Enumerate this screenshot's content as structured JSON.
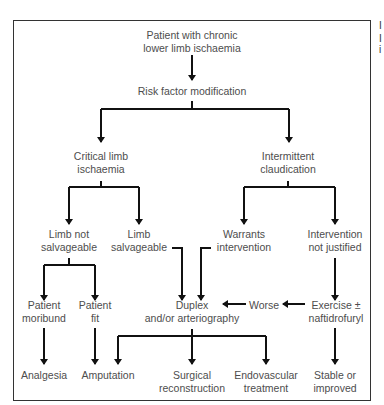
{
  "diagram": {
    "nodes": {
      "start": [
        "Patient with chronic",
        "lower limb ischaemia"
      ],
      "risk": [
        "Risk factor modification"
      ],
      "cli": [
        "Critical limb",
        "ischaemia"
      ],
      "ic": [
        "Intermittent",
        "claudication"
      ],
      "not_salv": [
        "Limb not",
        "salvageable"
      ],
      "salv": [
        "Limb",
        "salvageable"
      ],
      "warrants": [
        "Warrants",
        "intervention"
      ],
      "not_justified": [
        "Intervention",
        "not justified"
      ],
      "moribund": [
        "Patient",
        "moribund"
      ],
      "fit": [
        "Patient",
        "fit"
      ],
      "duplex": [
        "Duplex",
        "and/or arteriography"
      ],
      "worse": [
        "Worse"
      ],
      "exercise": [
        "Exercise ±",
        "naftidrofuryl"
      ],
      "analgesia": [
        "Analgesia"
      ],
      "amputation": [
        "Amputation"
      ],
      "surgical": [
        "Surgical",
        "reconstruction"
      ],
      "endovascular": [
        "Endovascular",
        "treatment"
      ],
      "stable": [
        "Stable or",
        "improved"
      ]
    },
    "edges": [
      [
        "start",
        "risk"
      ],
      [
        "risk",
        "cli"
      ],
      [
        "risk",
        "ic"
      ],
      [
        "cli",
        "not_salv"
      ],
      [
        "cli",
        "salv"
      ],
      [
        "ic",
        "warrants"
      ],
      [
        "ic",
        "not_justified"
      ],
      [
        "not_salv",
        "moribund"
      ],
      [
        "not_salv",
        "fit"
      ],
      [
        "salv",
        "duplex"
      ],
      [
        "warrants",
        "duplex"
      ],
      [
        "not_justified",
        "exercise"
      ],
      [
        "exercise",
        "worse"
      ],
      [
        "worse",
        "duplex"
      ],
      [
        "moribund",
        "analgesia"
      ],
      [
        "fit",
        "amputation"
      ],
      [
        "duplex",
        "amputation"
      ],
      [
        "duplex",
        "surgical"
      ],
      [
        "duplex",
        "endovascular"
      ],
      [
        "exercise",
        "stable"
      ]
    ],
    "side_text": [
      "I",
      "I",
      "i"
    ]
  }
}
